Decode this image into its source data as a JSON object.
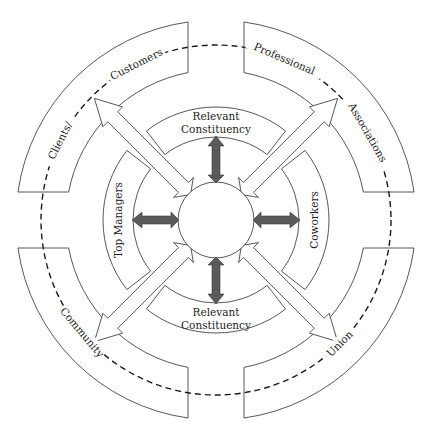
{
  "diagram": {
    "center": {
      "x": 216,
      "y": 220
    },
    "hub_radius": 38,
    "dashed_circle_radius": 175,
    "outer_band": {
      "r_inner": 150,
      "r_outer": 200,
      "gap": 28
    },
    "inner_ring": {
      "r_inner": 83,
      "r_outer": 113,
      "half_span_deg": 38
    },
    "colors": {
      "gray_arrow": "#5a5a5a",
      "line": "#444444",
      "dash": "#1a1a1a"
    },
    "outer_groups": [
      {
        "id": "top-left",
        "labels": [
          {
            "text": "Clients/",
            "angle": 207
          },
          {
            "text": "Customers",
            "angle": 243
          }
        ]
      },
      {
        "id": "top-right",
        "labels": [
          {
            "text": "Professional",
            "angle": 293
          },
          {
            "text": "Associations",
            "angle": 330
          }
        ]
      },
      {
        "id": "bottom-left",
        "labels": [
          {
            "text": "Community",
            "angle": 140
          }
        ]
      },
      {
        "id": "bottom-right",
        "labels": [
          {
            "text": "Union",
            "angle": 45
          }
        ]
      }
    ],
    "inner_groups": [
      {
        "id": "top",
        "angle": 270,
        "lines": [
          "Relevant",
          "Constituency"
        ]
      },
      {
        "id": "right",
        "angle": 0,
        "lines": [
          "Coworkers"
        ]
      },
      {
        "id": "bottom",
        "angle": 90,
        "lines": [
          "Relevant",
          "Constituency"
        ]
      },
      {
        "id": "left",
        "angle": 180,
        "lines": [
          "Top Managers"
        ]
      }
    ],
    "gray_arrows": [
      {
        "id": "up",
        "angle": 270
      },
      {
        "id": "right",
        "angle": 0
      },
      {
        "id": "down",
        "angle": 90
      },
      {
        "id": "left",
        "angle": 180
      }
    ],
    "white_arrows": [
      {
        "id": "to-clients-customers",
        "angle": 225
      },
      {
        "id": "to-professional-associations",
        "angle": 315
      },
      {
        "id": "to-community",
        "angle": 135
      },
      {
        "id": "to-union",
        "angle": 45
      }
    ]
  }
}
